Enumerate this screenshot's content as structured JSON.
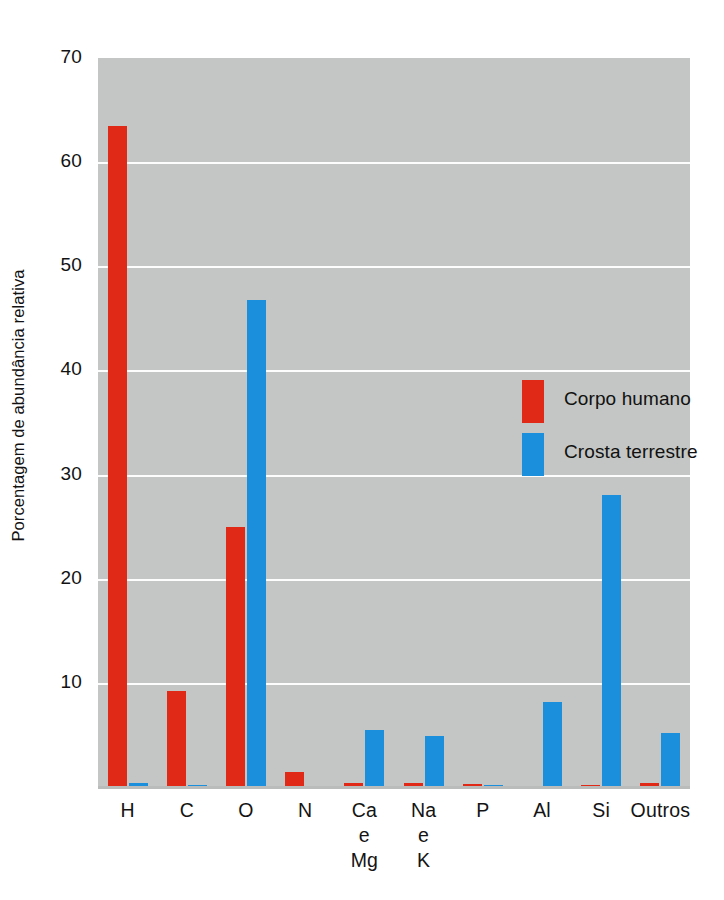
{
  "chart_data": {
    "type": "bar",
    "title": "",
    "subtitle": "",
    "xlabel": "",
    "ylabel": "Porcentagem de abundância relativa",
    "ylim": [
      0,
      70
    ],
    "yticks": [
      10,
      20,
      30,
      40,
      50,
      60,
      70
    ],
    "ytick_labels": [
      "10",
      "20",
      "30",
      "40",
      "50",
      "60",
      "70"
    ],
    "grid": "horizontal",
    "legend_position": "inside-upper-right",
    "categories": [
      "H",
      "C",
      "O",
      "N",
      "Ca e Mg",
      "Na e K",
      "P",
      "Al",
      "Si",
      "Outros"
    ],
    "category_lines": [
      [
        "H"
      ],
      [
        "C"
      ],
      [
        "O"
      ],
      [
        "N"
      ],
      [
        "Ca",
        "e",
        "Mg"
      ],
      [
        "Na",
        "e",
        "K"
      ],
      [
        "P"
      ],
      [
        "Al"
      ],
      [
        "Si"
      ],
      [
        "Outros"
      ]
    ],
    "series": [
      {
        "name": "Corpo humano",
        "color": "#e02a17",
        "values": [
          63.5,
          9.2,
          25.0,
          1.4,
          0.4,
          0.4,
          0.3,
          0.0,
          0.05,
          0.4
        ]
      },
      {
        "name": "Crosta terrestre",
        "color": "#1c8fdc",
        "values": [
          0.4,
          0.2,
          46.8,
          0.0,
          5.5,
          4.9,
          0.15,
          8.2,
          28.0,
          5.2
        ]
      }
    ],
    "plot_background": "#c3c6c4",
    "gridline_color": "#fdfdfd"
  },
  "legend": {
    "items": [
      {
        "label": "Corpo humano",
        "color": "#e02a17"
      },
      {
        "label": "Crosta terrestre",
        "color": "#1c8fdc"
      }
    ]
  },
  "bleed_text": {
    "top": "",
    "line1": "",
    "line2": "",
    "line3": "",
    "left": ""
  }
}
